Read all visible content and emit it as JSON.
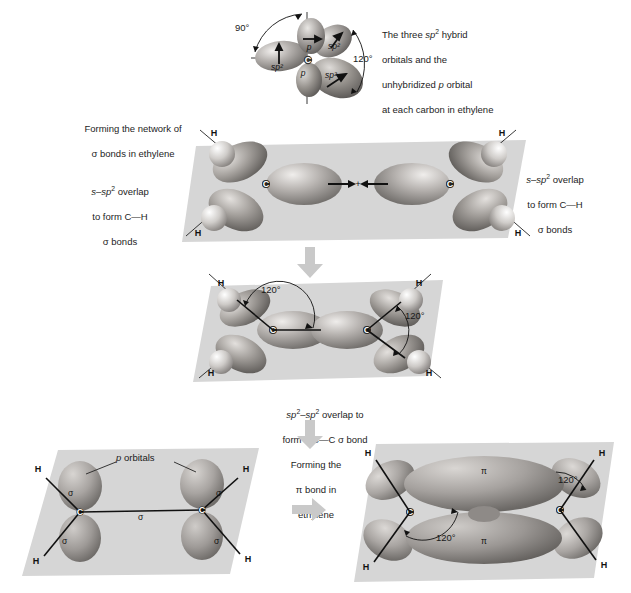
{
  "figure": {
    "background_color": "#ffffff",
    "plane_color": "#d5d5d5",
    "orbital_color_light": "#e8e6e4",
    "orbital_color_mid": "#a9a5a2",
    "orbital_color_dark": "#6d6a68",
    "block_arrow_color": "#c9c9c9"
  },
  "panel_top": {
    "caption": "The three sp2 hybrid\norbitals and the\nunhybridized p orbital\nat each carbon in ethylene",
    "caption_lines": [
      "The three sp² hybrid",
      "orbitals and the",
      "unhybridized p orbital",
      "at each carbon in ethylene"
    ],
    "angle_left": "90°",
    "angle_right": "120°",
    "atom_label": "C",
    "orbital_labels": [
      "p",
      "p",
      "sp²",
      "sp²",
      "sp²"
    ]
  },
  "panel_sigma": {
    "caption_top": "Forming the network of\nσ bonds in ethylene",
    "caption_top_lines": [
      "Forming the network of",
      "σ bonds in ethylene"
    ],
    "caption_left_lines": [
      "s–sp² overlap",
      "to form C—H",
      "σ bonds"
    ],
    "caption_right_lines": [
      "s–sp² overlap",
      "to form C—H",
      "σ bonds"
    ],
    "plus_sign": "+",
    "h_labels": [
      "H",
      "H",
      "H",
      "H"
    ],
    "c_labels": [
      "C",
      "C"
    ]
  },
  "panel_middle": {
    "caption_lines": [
      "sp²–sp² overlap to",
      "form a C—C σ bond"
    ],
    "angle_labels": [
      "120°",
      "120°"
    ],
    "h_labels": [
      "H",
      "H",
      "H",
      "H"
    ],
    "c_labels": [
      "C",
      "C"
    ]
  },
  "panel_bottom_left": {
    "p_orbital_label": "p orbitals",
    "sigma_labels": [
      "σ",
      "σ",
      "σ",
      "σ",
      "σ"
    ],
    "h_labels": [
      "H",
      "H",
      "H",
      "H"
    ],
    "c_labels": [
      "C",
      "C"
    ]
  },
  "panel_bottom_arrow": {
    "caption_lines": [
      "Forming the",
      "π bond in",
      "ethylene"
    ]
  },
  "panel_bottom_right": {
    "pi_labels": [
      "π",
      "π"
    ],
    "angle_labels": [
      "120°",
      "120°"
    ],
    "h_labels": [
      "H",
      "H",
      "H",
      "H"
    ],
    "c_labels": [
      "C",
      "C"
    ]
  }
}
